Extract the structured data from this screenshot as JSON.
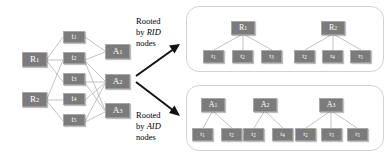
{
  "diagram": {
    "colors": {
      "node_fill": "#7b7b7b",
      "node_text": "#ffffff",
      "edge": "#b9b9b9",
      "arrow": "#111111",
      "panel_border": "#d2d2d2",
      "background": "#ffffff"
    },
    "left_graph": {
      "name": "bipartite-tripartite-graph",
      "rid_nodes": [
        {
          "id": "R1",
          "base": "R",
          "sub": "1"
        },
        {
          "id": "R2",
          "base": "R",
          "sub": "2"
        }
      ],
      "t_nodes": [
        {
          "id": "t1",
          "base": "t",
          "sub": "1"
        },
        {
          "id": "t2",
          "base": "t",
          "sub": "2"
        },
        {
          "id": "t3",
          "base": "t",
          "sub": "3"
        },
        {
          "id": "t4",
          "base": "t",
          "sub": "4"
        },
        {
          "id": "t5",
          "base": "t",
          "sub": "5"
        }
      ],
      "aid_nodes": [
        {
          "id": "A1",
          "base": "A",
          "sub": "1"
        },
        {
          "id": "A2",
          "base": "A",
          "sub": "2"
        },
        {
          "id": "A3",
          "base": "A",
          "sub": "3"
        }
      ],
      "rid_to_t_edges": [
        [
          "R1",
          "t1"
        ],
        [
          "R1",
          "t2"
        ],
        [
          "R1",
          "t3"
        ],
        [
          "R2",
          "t2"
        ],
        [
          "R2",
          "t4"
        ],
        [
          "R2",
          "t5"
        ]
      ],
      "t_to_aid_edges": [
        [
          "t1",
          "A1"
        ],
        [
          "t2",
          "A1"
        ],
        [
          "t2",
          "A2"
        ],
        [
          "t4",
          "A2"
        ],
        [
          "t2",
          "A3"
        ],
        [
          "t3",
          "A3"
        ],
        [
          "t5",
          "A3"
        ],
        [
          "t3",
          "A2"
        ],
        [
          "t5",
          "A2"
        ]
      ]
    },
    "arrows": [
      {
        "name": "arrow-to-rid-panel",
        "label_ref": "captions.0"
      },
      {
        "name": "arrow-to-aid-panel",
        "label_ref": "captions.1"
      }
    ],
    "captions": [
      {
        "line1": "Rooted",
        "line2_prefix": "by ",
        "line2_em": "RID",
        "line3": "nodes"
      },
      {
        "line1": "Rooted",
        "line2_prefix": "by ",
        "line2_em": "AID",
        "line3": "nodes"
      }
    ],
    "panels": [
      {
        "name": "rid-rooted-panel",
        "trees": [
          {
            "root": {
              "id": "R1",
              "base": "R",
              "sub": "1"
            },
            "leaves": [
              {
                "id": "t1",
                "base": "t",
                "sub": "1"
              },
              {
                "id": "t2",
                "base": "t",
                "sub": "2"
              },
              {
                "id": "t3",
                "base": "t",
                "sub": "3"
              }
            ]
          },
          {
            "root": {
              "id": "R2",
              "base": "R",
              "sub": "2"
            },
            "leaves": [
              {
                "id": "t2",
                "base": "t",
                "sub": "2"
              },
              {
                "id": "t4",
                "base": "t",
                "sub": "4"
              },
              {
                "id": "t5",
                "base": "t",
                "sub": "5"
              }
            ]
          }
        ]
      },
      {
        "name": "aid-rooted-panel",
        "trees": [
          {
            "root": {
              "id": "A1",
              "base": "A",
              "sub": "1"
            },
            "leaves": [
              {
                "id": "t1",
                "base": "t",
                "sub": "1"
              },
              {
                "id": "t2",
                "base": "t",
                "sub": "2"
              }
            ]
          },
          {
            "root": {
              "id": "A2",
              "base": "A",
              "sub": "2"
            },
            "leaves": [
              {
                "id": "t2",
                "base": "t",
                "sub": "2"
              },
              {
                "id": "t4",
                "base": "t",
                "sub": "4"
              }
            ]
          },
          {
            "root": {
              "id": "A3",
              "base": "A",
              "sub": "3"
            },
            "leaves": [
              {
                "id": "t2",
                "base": "t",
                "sub": "2"
              },
              {
                "id": "t3",
                "base": "t",
                "sub": "3"
              },
              {
                "id": "t5",
                "base": "t",
                "sub": "5"
              }
            ]
          }
        ]
      }
    ]
  }
}
